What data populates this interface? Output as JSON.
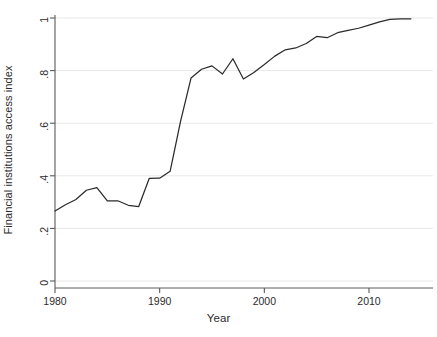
{
  "chart_data": {
    "type": "line",
    "title": "",
    "xlabel": "Year",
    "ylabel": "Financial institutions access index",
    "xlim": [
      1979,
      2015
    ],
    "ylim": [
      0,
      1
    ],
    "xticks": [
      1980,
      1990,
      2000,
      2010
    ],
    "xtick_labels": [
      "1980",
      "1990",
      "2000",
      "2010"
    ],
    "yticks": [
      0,
      0.2,
      0.4,
      0.6,
      0.8,
      1
    ],
    "ytick_labels": [
      "0",
      ".2",
      ".4",
      ".6",
      ".8",
      "1"
    ],
    "grid": true,
    "grid_axis": "y",
    "legend": false,
    "legend_position": "none",
    "line_color": "#2b2b2b",
    "grid_color": "#e8e8e8",
    "axis_color": "#5a5a5a",
    "background_color": "#ffffff",
    "series": [
      {
        "name": "Financial institutions access index",
        "x": [
          1980,
          1981,
          1982,
          1983,
          1984,
          1985,
          1986,
          1987,
          1988,
          1989,
          1990,
          1991,
          1992,
          1993,
          1994,
          1995,
          1996,
          1997,
          1998,
          1999,
          2000,
          2001,
          2002,
          2003,
          2004,
          2005,
          2006,
          2007,
          2008,
          2009,
          2010,
          2011,
          2012,
          2013,
          2014
        ],
        "values": [
          0.266,
          0.29,
          0.31,
          0.345,
          0.355,
          0.305,
          0.305,
          0.288,
          0.283,
          0.39,
          0.391,
          0.417,
          0.608,
          0.772,
          0.805,
          0.818,
          0.787,
          0.845,
          0.768,
          0.793,
          0.823,
          0.855,
          0.879,
          0.886,
          0.903,
          0.93,
          0.925,
          0.944,
          0.953,
          0.961,
          0.973,
          0.985,
          0.995,
          0.997,
          0.997
        ]
      }
    ]
  },
  "axes": {
    "y_title": "Financial institutions access index",
    "x_title": "Year"
  }
}
